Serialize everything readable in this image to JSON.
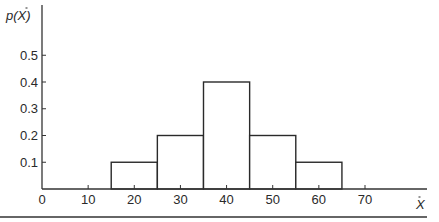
{
  "chart_data": {
    "type": "bar",
    "subtype": "histogram",
    "title": "",
    "xlabel": "X̄",
    "ylabel": "p(X̄)",
    "bins": [
      {
        "from": 15,
        "to": 25,
        "center": 20,
        "value": 0.1
      },
      {
        "from": 25,
        "to": 35,
        "center": 30,
        "value": 0.2
      },
      {
        "from": 35,
        "to": 45,
        "center": 40,
        "value": 0.4
      },
      {
        "from": 45,
        "to": 55,
        "center": 50,
        "value": 0.2
      },
      {
        "from": 55,
        "to": 65,
        "center": 60,
        "value": 0.1
      }
    ],
    "categories": [
      "20",
      "30",
      "40",
      "50",
      "60"
    ],
    "values": [
      0.1,
      0.2,
      0.4,
      0.2,
      0.1
    ],
    "x_ticks": [
      "0",
      "10",
      "20",
      "30",
      "40",
      "50",
      "60",
      "70"
    ],
    "y_ticks": [
      "0.1",
      "0.2",
      "0.3",
      "0.4",
      "0.5"
    ],
    "xlim": [
      0,
      80
    ],
    "ylim": [
      0,
      0.68
    ],
    "grid": false,
    "legend": null
  },
  "labels": {
    "ylabel_main": "p(X)",
    "xlabel_main": "X"
  }
}
